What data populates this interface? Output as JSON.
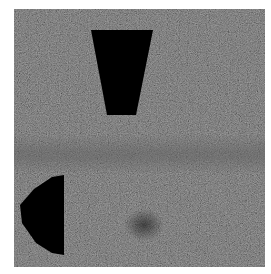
{
  "image": {
    "description": "Grayscale noisy texture with two solid black occluding shapes",
    "background_color": "#2a2a2a",
    "band_color": "#5f5f5f",
    "shape_color": "#000000",
    "frame": {
      "x": 14,
      "y": 9,
      "width": 251,
      "height": 258
    }
  },
  "shapes": [
    {
      "name": "trapezoid",
      "points": "77,21 139,21 122,106 93,106"
    },
    {
      "name": "half-disc",
      "points": "50,166 50,246 38,244 22,234 8,214 6,196 20,180 38,168"
    }
  ]
}
